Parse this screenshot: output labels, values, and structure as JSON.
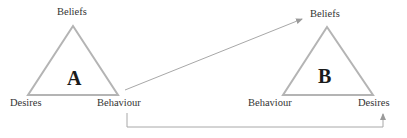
{
  "diagram": {
    "colors": {
      "line": "#b4b4b4",
      "arrow": "#9a9a9a",
      "text": "#333333"
    },
    "triangle_a": {
      "label": "A",
      "top": "Beliefs",
      "bottom_left": "Desires",
      "bottom_right": "Behaviour"
    },
    "triangle_b": {
      "label": "B",
      "top": "Beliefs",
      "bottom_left": "Behaviour",
      "bottom_right": "Desires"
    },
    "connections": [
      {
        "from": "A.Behaviour",
        "to": "B.Beliefs"
      },
      {
        "from": "A.Behaviour",
        "to": "B.Desires"
      }
    ]
  }
}
